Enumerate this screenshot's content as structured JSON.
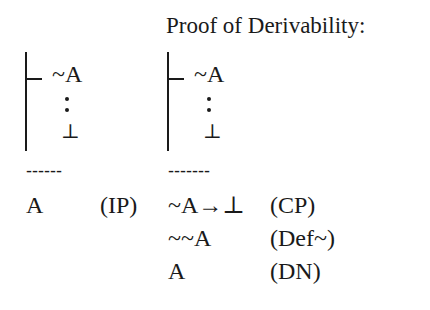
{
  "title": "Proof of Derivability:",
  "left_proof": {
    "assumption": "~A",
    "contradiction": "⊥",
    "separator": "------",
    "conclusion": "A",
    "rule": "(IP)"
  },
  "right_proof": {
    "assumption": "~A",
    "contradiction": "⊥",
    "separator": "-------",
    "steps": [
      {
        "formula": "~A→⊥",
        "rule": "(CP)"
      },
      {
        "formula": "~~A",
        "rule": "(Def~)"
      },
      {
        "formula": "A",
        "rule": "(DN)"
      }
    ]
  }
}
